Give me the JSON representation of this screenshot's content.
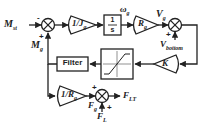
{
  "diagram": {
    "type": "control block diagram",
    "inputs": {
      "m_st": "M",
      "m_st_sub": "st",
      "m_g": "M",
      "m_g_sub": "g",
      "v_bottom": "V",
      "v_bottom_sub": "bottom",
      "f_l": "F",
      "f_l_sub": "L"
    },
    "signals": {
      "omega_g": "ω",
      "omega_g_sub": "g",
      "v_g": "V",
      "v_g_sub": "g",
      "f_g": "F",
      "f_g_sub": "g"
    },
    "outputs": {
      "f_lt": "F",
      "f_lt_sub": "LT"
    },
    "blocks": {
      "gain_inv_jg": "1/J",
      "gain_inv_jg_sub": "g",
      "integrator_num": "1",
      "integrator_den": "s",
      "gain_rg": "R",
      "gain_rg_sub": "g",
      "gain_k": "K",
      "saturation": "saturation",
      "filter": "Filter",
      "gain_inv_rg": "1/R",
      "gain_inv_rg_sub": "g"
    },
    "signs": {
      "sum1_top": "-",
      "sum1_bottom": "+",
      "sum2_left": "+",
      "sum2_bottom": "-",
      "sum3_left": "+",
      "sum3_bottom": "+"
    }
  }
}
